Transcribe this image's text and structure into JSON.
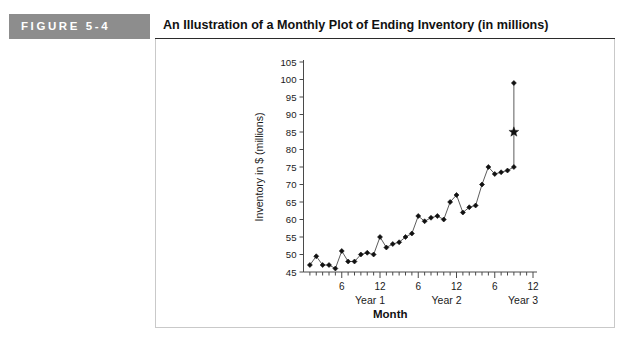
{
  "figure": {
    "badge_label": "FIGURE  5-4",
    "title": "An Illustration of a Monthly Plot of Ending Inventory (in millions)"
  },
  "chart_data": {
    "type": "line",
    "title": "An Illustration of a Monthly Plot of Ending Inventory (in millions)",
    "xlabel": "Month",
    "ylabel": "Inventory in $ (millions)",
    "ylim": [
      45,
      105
    ],
    "xlim": [
      0,
      36
    ],
    "ytick_labels": [
      "45",
      "50",
      "55",
      "60",
      "65",
      "70",
      "75",
      "80",
      "85",
      "90",
      "95",
      "100",
      "105"
    ],
    "ytick_values": [
      45,
      50,
      55,
      60,
      65,
      70,
      75,
      80,
      85,
      90,
      95,
      100,
      105
    ],
    "xtick_labels": [
      "6",
      "12",
      "6",
      "12",
      "6",
      "12"
    ],
    "xtick_values": [
      6,
      12,
      18,
      24,
      30,
      36
    ],
    "xminor_step": 1,
    "group_labels": [
      "Year 1",
      "Year 2",
      "Year 3"
    ],
    "group_label_positions": [
      12,
      24,
      36
    ],
    "grid": false,
    "legend": "none",
    "marker": "diamond",
    "x": [
      1,
      2,
      3,
      4,
      5,
      6,
      7,
      8,
      9,
      10,
      11,
      12,
      13,
      14,
      15,
      16,
      17,
      18,
      19,
      20,
      21,
      22,
      23,
      24,
      25,
      26,
      27,
      28,
      29,
      30,
      31,
      32,
      33
    ],
    "values": [
      47,
      49.5,
      47,
      47,
      46,
      51,
      48,
      48,
      50,
      50.5,
      50,
      55,
      52,
      53,
      53.5,
      55,
      56,
      61,
      59.5,
      60.5,
      61,
      60,
      65,
      67,
      62,
      63.5,
      64,
      70,
      75,
      73,
      73.5,
      74,
      75
    ],
    "final_point": {
      "x": 33,
      "y": 99,
      "marker": "diamond"
    },
    "annotations": [
      {
        "name": "forecast-star",
        "x": 33,
        "y": 85,
        "marker": "star",
        "label": ""
      }
    ]
  }
}
